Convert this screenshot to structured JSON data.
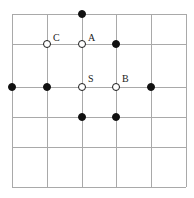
{
  "figure": {
    "name": "lattice-point-diagram",
    "width": 194,
    "height": 198,
    "background_color": "#ffffff"
  },
  "grid": {
    "line_color": "#a9a9a9",
    "line_width": 1,
    "vertical_x": [
      11.5,
      46.5,
      81.5,
      116.0,
      150.5,
      185.5
    ],
    "horizontal_y": [
      14.0,
      43.5,
      87.0,
      116.5,
      146.5,
      186.5
    ],
    "columns": 5,
    "rows": 5
  },
  "markers": {
    "filled_color": "#111111",
    "open_fill_color": "#ffffff",
    "open_stroke_color": "#1a1a1a",
    "radius": 4
  },
  "points": [
    {
      "id": "p1",
      "type": "filled",
      "x": 81.5,
      "y": 14.0,
      "label": ""
    },
    {
      "id": "p2",
      "type": "open",
      "x": 46.5,
      "y": 43.5,
      "label": "C"
    },
    {
      "id": "p3",
      "type": "open",
      "x": 81.5,
      "y": 43.5,
      "label": "A"
    },
    {
      "id": "p4",
      "type": "filled",
      "x": 116.0,
      "y": 43.5,
      "label": ""
    },
    {
      "id": "p5",
      "type": "filled",
      "x": 11.5,
      "y": 87.0,
      "label": ""
    },
    {
      "id": "p6",
      "type": "filled",
      "x": 46.5,
      "y": 87.0,
      "label": ""
    },
    {
      "id": "p7",
      "type": "open",
      "x": 81.5,
      "y": 87.0,
      "label": "S"
    },
    {
      "id": "p8",
      "type": "open",
      "x": 116.0,
      "y": 87.0,
      "label": "B"
    },
    {
      "id": "p9",
      "type": "filled",
      "x": 150.5,
      "y": 87.0,
      "label": ""
    },
    {
      "id": "p10",
      "type": "filled",
      "x": 81.5,
      "y": 116.5,
      "label": ""
    },
    {
      "id": "p11",
      "type": "filled",
      "x": 116.0,
      "y": 116.5,
      "label": ""
    }
  ],
  "labels": [
    {
      "text": "C",
      "x": 53,
      "y": 33
    },
    {
      "text": "A",
      "x": 88,
      "y": 33
    },
    {
      "text": "S",
      "x": 88,
      "y": 74
    },
    {
      "text": "B",
      "x": 122,
      "y": 74
    }
  ]
}
